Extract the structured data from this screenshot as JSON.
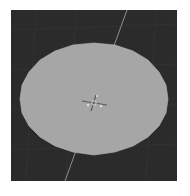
{
  "viewport": {
    "label": "3D Viewport",
    "background_color": "#2b2b2b",
    "grid_color": "#363636",
    "axis_line_color": "#8a8a8a",
    "object": {
      "type": "circle-mesh",
      "fill_color": "#a6a6a6",
      "edge_color": "#c0c0c0",
      "vertices": 24
    },
    "gizmo": {
      "type": "origin-transform-gizmo",
      "color": "#555555"
    }
  }
}
